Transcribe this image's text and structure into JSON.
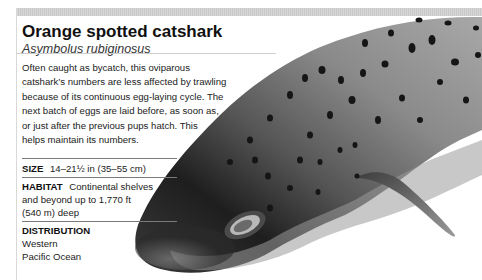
{
  "species": {
    "common_name": "Orange spotted catshark",
    "scientific_name": "Asymbolus rubiginosus",
    "description": "Often caught as bycatch, this oviparous catshark’s numbers are less affected by trawling because of its continuous egg-laying cycle. The next batch of eggs are laid before, as soon as, or just after the previous pups hatch. This helps maintain its numbers.",
    "description_lines": [
      "Often caught as bycatch, this oviparous",
      "catshark’s numbers are less affected by trawling",
      "because of its continuous egg-laying cycle. The",
      "next batch of eggs are laid before, as soon as,",
      "or just after the previous pups hatch. This",
      "helps maintain its numbers."
    ]
  },
  "stats": {
    "size": {
      "label": "SIZE",
      "value": "14–21½ in (35–55 cm)"
    },
    "habitat": {
      "label": "HABITAT",
      "value_lines": [
        "Continental shelves",
        "and beyond up to 1,770 ft",
        "(540 m) deep"
      ]
    },
    "distribution": {
      "label": "DISTRIBUTION",
      "value_lines": [
        "Western",
        "Pacific Ocean"
      ]
    }
  },
  "image": {
    "subject": "shark-photo",
    "colors": {
      "body_dark": "#1c1c1c",
      "body_mid": "#6e6e6e",
      "body_light": "#bdbdbd",
      "spots": "#151515"
    }
  }
}
